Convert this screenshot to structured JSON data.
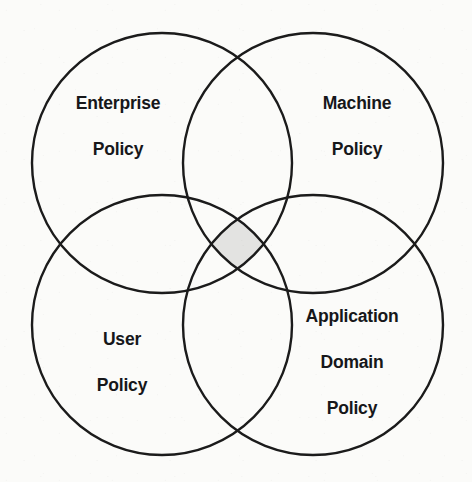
{
  "diagram": {
    "kind": "venn-diagram",
    "canvas": {
      "width": 472,
      "height": 482,
      "background": "#fbfbf9"
    },
    "style": {
      "stroke_color": "#1b1b1b",
      "stroke_width": 2.4,
      "label_color": "#16171a",
      "intersection_fill": "#e3e3e1"
    },
    "sets": [
      {
        "id": "enterprise-policy",
        "label": "Enterprise\nPolicy",
        "label_lines": [
          "Enterprise",
          "Policy"
        ],
        "cx": 162,
        "cy": 163,
        "r": 130,
        "label_x": 118,
        "label_y": 127
      },
      {
        "id": "machine-policy",
        "label": "Machine\nPolicy",
        "label_lines": [
          "Machine",
          "Policy"
        ],
        "cx": 313,
        "cy": 163,
        "r": 130,
        "label_x": 357,
        "label_y": 127
      },
      {
        "id": "user-policy",
        "label": "User\nPolicy",
        "label_lines": [
          "User",
          "Policy"
        ],
        "cx": 162,
        "cy": 325,
        "r": 130,
        "label_x": 122,
        "label_y": 363
      },
      {
        "id": "application-domain-policy",
        "label": "Application\nDomain\nPolicy",
        "label_lines": [
          "Application",
          "Domain",
          "Policy"
        ],
        "cx": 313,
        "cy": 325,
        "r": 130,
        "label_x": 352,
        "label_y": 363
      }
    ],
    "intersection": {
      "id": "all-four-intersection",
      "label": "",
      "shaded": true,
      "fill": "#e3e3e1",
      "center_x": 238,
      "center_y": 240
    }
  }
}
